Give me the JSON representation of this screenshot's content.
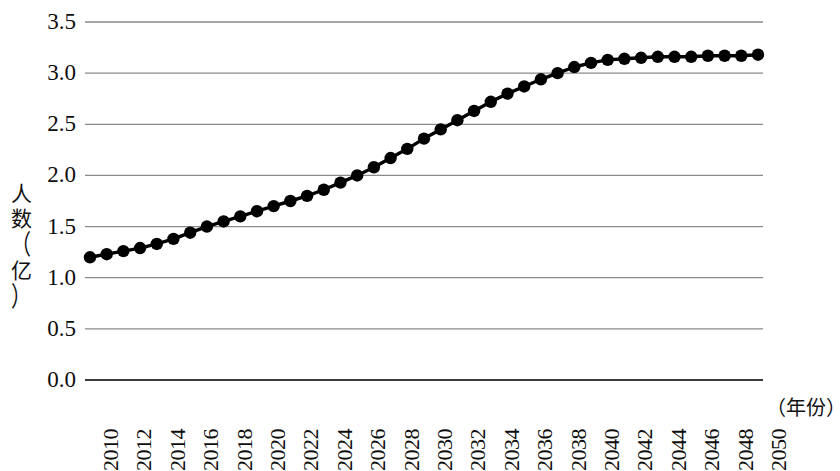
{
  "chart_data": {
    "type": "line",
    "title": "",
    "xlabel": "（年份）",
    "ylabel": "人数（亿）",
    "ylabel_chars": [
      "人",
      "数",
      "（",
      "亿",
      "）"
    ],
    "xlim": [
      2010,
      2050
    ],
    "ylim": [
      0.0,
      3.5
    ],
    "y_ticks": [
      "3.5",
      "3.0",
      "2.5",
      "2.0",
      "1.5",
      "1.0",
      "0.5",
      "0.0"
    ],
    "y_tick_values": [
      3.5,
      3.0,
      2.5,
      2.0,
      1.5,
      1.0,
      0.5,
      0.0
    ],
    "x_ticks": [
      "2010",
      "2012",
      "2014",
      "2016",
      "2018",
      "2020",
      "2022",
      "2024",
      "2026",
      "2028",
      "2030",
      "2032",
      "2034",
      "2036",
      "2038",
      "2040",
      "2042",
      "2044",
      "2046",
      "2048",
      "2050"
    ],
    "x_tick_values": [
      2010,
      2012,
      2014,
      2016,
      2018,
      2020,
      2022,
      2024,
      2026,
      2028,
      2030,
      2032,
      2034,
      2036,
      2038,
      2040,
      2042,
      2044,
      2046,
      2048,
      2050
    ],
    "grid": "horizontal",
    "legend": "none",
    "marker": "filled-circle",
    "line_color": "#000000",
    "marker_color": "#000000",
    "grid_color": "#8a8a8a",
    "axis_color": "#4a4a4a",
    "x": [
      2010,
      2011,
      2012,
      2013,
      2014,
      2015,
      2016,
      2017,
      2018,
      2019,
      2020,
      2021,
      2022,
      2023,
      2024,
      2025,
      2026,
      2027,
      2028,
      2029,
      2030,
      2031,
      2032,
      2033,
      2034,
      2035,
      2036,
      2037,
      2038,
      2039,
      2040,
      2041,
      2042,
      2043,
      2044,
      2045,
      2046,
      2047,
      2048,
      2049,
      2050
    ],
    "values": [
      1.2,
      1.23,
      1.26,
      1.29,
      1.33,
      1.38,
      1.44,
      1.5,
      1.55,
      1.6,
      1.65,
      1.7,
      1.75,
      1.8,
      1.86,
      1.93,
      2.0,
      2.08,
      2.17,
      2.26,
      2.36,
      2.45,
      2.54,
      2.63,
      2.72,
      2.8,
      2.87,
      2.94,
      3.0,
      3.06,
      3.1,
      3.13,
      3.14,
      3.15,
      3.16,
      3.16,
      3.16,
      3.17,
      3.17,
      3.17,
      3.18
    ]
  }
}
